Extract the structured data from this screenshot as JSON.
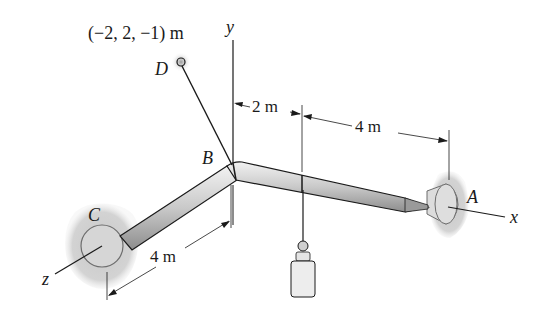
{
  "diagram": {
    "type": "3D statics rod assembly",
    "points": {
      "A": "A",
      "B": "B",
      "C": "C",
      "D": "D"
    },
    "axes": {
      "x": "x",
      "y": "y",
      "z": "z"
    },
    "coordinate_label": "(−2, 2, −1) m",
    "dimensions": {
      "b_to_load": "2 m",
      "load_to_a": "4 m",
      "b_to_c": "4 m"
    },
    "colors": {
      "rod": "#c8c8c8",
      "rod_edge": "#1a1a1a",
      "support_shade": "#cfcfcf",
      "line": "#1a1a1a"
    }
  }
}
